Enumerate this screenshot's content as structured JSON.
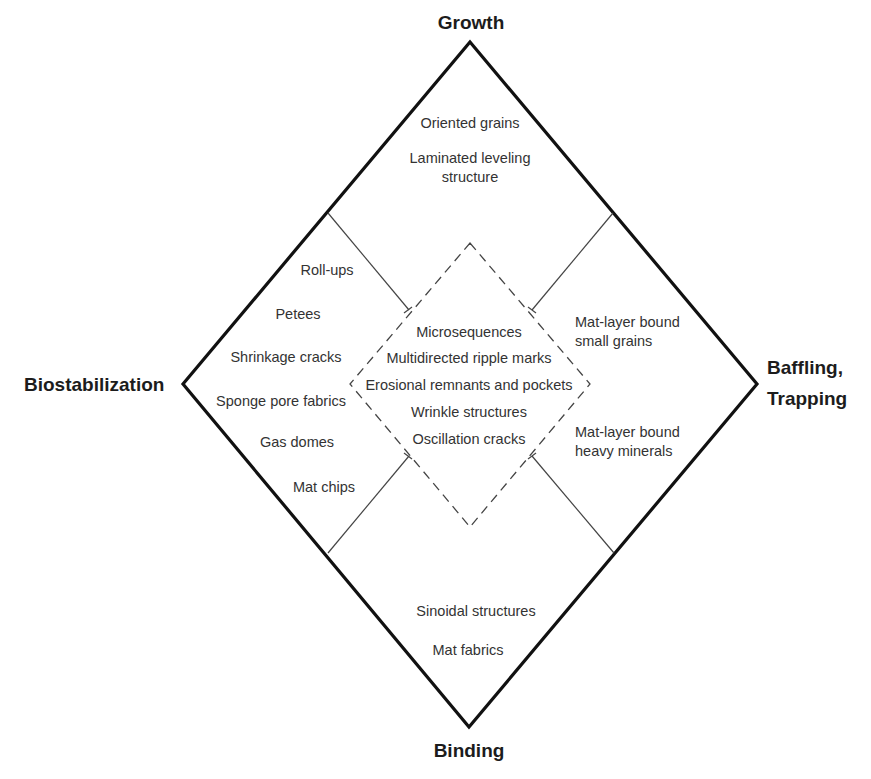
{
  "diagram": {
    "poles": {
      "top": "Growth",
      "left": "Biostabilization",
      "right_line1": "Baffling,",
      "right_line2": "Trapping",
      "bottom": "Binding"
    },
    "regions": {
      "growth": [
        "Oriented grains",
        "Laminated leveling",
        "structure"
      ],
      "biostabilization": [
        "Roll-ups",
        "Petees",
        "Shrinkage cracks",
        "Sponge pore fabrics",
        "Gas domes",
        "Mat chips"
      ],
      "baffling_trapping": [
        "Mat-layer bound",
        "small grains",
        "Mat-layer bound",
        "heavy minerals"
      ],
      "binding": [
        "Sinoidal structures",
        "Mat fabrics"
      ],
      "center": [
        "Microsequences",
        "Multidirected ripple marks",
        "Erosional remnants and pockets",
        "Wrinkle structures",
        "Oscillation cracks"
      ]
    },
    "colors": {
      "outer_line": "#111111",
      "inner_line": "#333333",
      "text": "#333333"
    }
  }
}
